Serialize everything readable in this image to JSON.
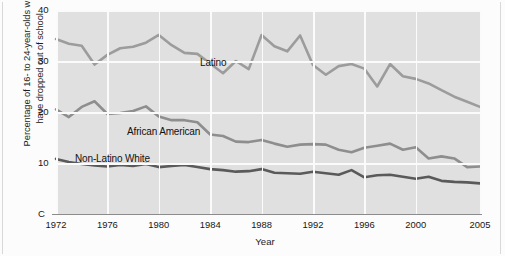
{
  "chart_data": {
    "type": "line",
    "title": "",
    "xlabel": "Year",
    "ylabel": "Percentage of 16- to 24-year-olds who have dropped out of school",
    "ylabel_line1": "Percentage of 16- to 24-year-olds who",
    "ylabel_line2": "have dropped out of school",
    "xlim": [
      1972,
      2005
    ],
    "ylim": [
      0,
      40
    ],
    "yticks": [
      "C",
      "10",
      "20",
      "30",
      "40"
    ],
    "ytick_values": [
      0,
      10,
      20,
      30,
      40
    ],
    "xticks": [
      "1972",
      "1976",
      "1980",
      "1984",
      "1988",
      "1992",
      "1996",
      "2000",
      "2005"
    ],
    "xtick_values": [
      1972,
      1976,
      1980,
      1984,
      1988,
      1992,
      1996,
      2000,
      2005
    ],
    "grid": true,
    "legend_position": "inline-annotations",
    "x": [
      1972,
      1973,
      1974,
      1975,
      1976,
      1977,
      1978,
      1979,
      1980,
      1981,
      1982,
      1983,
      1984,
      1985,
      1986,
      1987,
      1988,
      1989,
      1990,
      1991,
      1992,
      1993,
      1994,
      1995,
      1996,
      1997,
      1998,
      1999,
      2000,
      2001,
      2002,
      2003,
      2004,
      2005
    ],
    "series": [
      {
        "name": "Latino",
        "color": "#9c9c9c",
        "label_x": 200,
        "label_y": 57,
        "values": [
          34.3,
          33.4,
          33.0,
          29.3,
          31.2,
          32.5,
          32.8,
          33.6,
          35.1,
          33.1,
          31.6,
          31.4,
          29.5,
          27.6,
          30.0,
          28.4,
          35.1,
          32.9,
          31.9,
          35.0,
          29.2,
          27.3,
          29.0,
          29.4,
          28.5,
          25.0,
          29.4,
          27.0,
          26.5,
          25.6,
          24.3,
          23.0,
          22.0,
          21.0
        ]
      },
      {
        "name": "African American",
        "color": "#8e8e8e",
        "label_x": 127,
        "label_y": 126,
        "values": [
          20.5,
          19.0,
          21.0,
          22.1,
          19.6,
          19.8,
          20.2,
          21.1,
          19.1,
          18.4,
          18.4,
          18.0,
          15.6,
          15.3,
          14.2,
          14.1,
          14.5,
          13.8,
          13.2,
          13.6,
          13.7,
          13.6,
          12.6,
          12.1,
          13.0,
          13.4,
          13.8,
          12.6,
          13.1,
          10.9,
          11.3,
          10.9,
          9.2,
          9.3
        ]
      },
      {
        "name": "Non-Latino White",
        "color": "#5a5a5a",
        "label_x": 75,
        "label_y": 153,
        "values": [
          10.8,
          10.2,
          9.8,
          9.5,
          9.3,
          9.6,
          9.4,
          9.8,
          9.2,
          9.4,
          9.6,
          9.2,
          8.8,
          8.6,
          8.3,
          8.4,
          8.8,
          8.1,
          8.0,
          7.9,
          8.3,
          8.0,
          7.7,
          8.6,
          7.2,
          7.6,
          7.7,
          7.3,
          6.9,
          7.3,
          6.5,
          6.3,
          6.2,
          6.0
        ]
      }
    ]
  },
  "axes": {
    "y_ticks_display": [
      {
        "label": "40",
        "value": 40
      },
      {
        "label": "30",
        "value": 30
      },
      {
        "label": "20",
        "value": 20
      },
      {
        "label": "10",
        "value": 10
      },
      {
        "label": "C",
        "value": 0
      }
    ]
  }
}
